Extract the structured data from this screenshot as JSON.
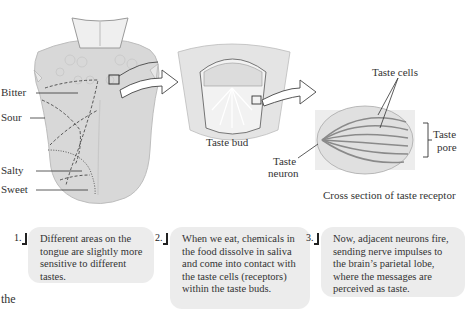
{
  "figure": {
    "tongue": {
      "labels": [
        "Bitter",
        "Sour",
        "Salty",
        "Sweet"
      ]
    },
    "taste_bud": {
      "caption": "Taste bud"
    },
    "receptor": {
      "labels": {
        "taste_cells": "Taste cells",
        "taste_pore_line1": "Taste",
        "taste_pore_line2": "pore",
        "taste_neuron_line1": "Taste",
        "taste_neuron_line2": "neuron"
      },
      "caption": "Cross section of taste receptor"
    }
  },
  "steps": [
    {
      "number": "1.",
      "text": "Different areas on the tongue are slightly more sensitive to different tastes."
    },
    {
      "number": "2.",
      "text": "When we eat, chemicals in the food dissolve in saliva and come into contact with the taste cells (receptors) within the taste buds."
    },
    {
      "number": "3.",
      "text": "Now, adjacent neurons fire, sending nerve impulses to the brain’s parietal lobe, where the messages are perceived as taste."
    }
  ],
  "footer": {
    "text": "the"
  },
  "colors": {
    "box_bg": "#ececec",
    "tissue": "#d6d6d6",
    "text": "#333333"
  }
}
